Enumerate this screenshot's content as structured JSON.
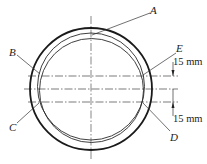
{
  "diagram": {
    "labels": {
      "A": "A",
      "B": "B",
      "C": "C",
      "D": "D",
      "E": "E"
    },
    "dimensions": {
      "upper": "15 mm",
      "lower": "15 mm"
    },
    "colors": {
      "stroke": "#222222",
      "background": "#ffffff"
    }
  }
}
